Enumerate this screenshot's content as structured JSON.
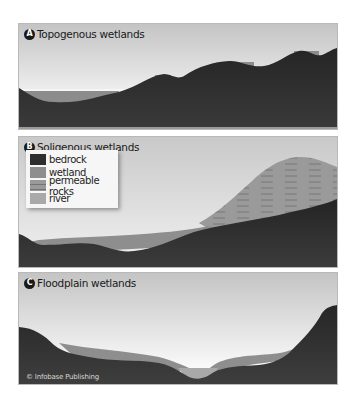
{
  "figure": {
    "colors": {
      "bedrock": "#2e2e2e",
      "wetland": "#8e8e8e",
      "permeable_rocks": "#9a9a9a",
      "river": "#a9a9a9",
      "sky_top": "#c7c7c7",
      "sky_bottom": "#f3f3f3",
      "border": "#b9b9b9"
    },
    "panels": [
      {
        "badge": "A",
        "title": "Topogenous wetlands"
      },
      {
        "badge": "B",
        "title": "Soligenous wetlands"
      },
      {
        "badge": "C",
        "title": "Floodplain wetlands"
      }
    ],
    "legend": {
      "items": [
        {
          "label": "bedrock"
        },
        {
          "label": "wetland"
        },
        {
          "label": "permeable rocks"
        },
        {
          "label": "river"
        }
      ]
    },
    "credit": "© Infobase Publishing"
  }
}
